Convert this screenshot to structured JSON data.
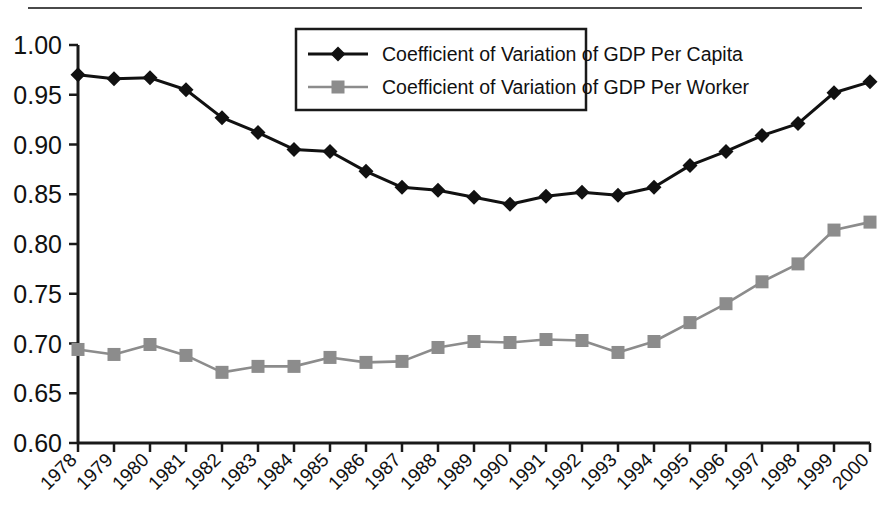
{
  "figure": {
    "has_top_rule": true,
    "background_color": "#ffffff"
  },
  "chart_data": {
    "type": "line",
    "title": "",
    "subtitle": "",
    "xlabel": "",
    "ylabel": "",
    "x": [
      1978,
      1979,
      1980,
      1981,
      1982,
      1983,
      1984,
      1985,
      1986,
      1987,
      1988,
      1989,
      1990,
      1991,
      1992,
      1993,
      1994,
      1995,
      1996,
      1997,
      1998,
      1999,
      2000
    ],
    "categories": [
      "1978",
      "1979",
      "1980",
      "1981",
      "1982",
      "1983",
      "1984",
      "1985",
      "1986",
      "1987",
      "1988",
      "1989",
      "1990",
      "1991",
      "1992",
      "1993",
      "1994",
      "1995",
      "1996",
      "1997",
      "1998",
      "1999",
      "2000"
    ],
    "series": [
      {
        "name": "Coefficient of Variation of GDP Per Capita",
        "color": "#111111",
        "marker": "diamond",
        "values": [
          0.97,
          0.966,
          0.967,
          0.955,
          0.927,
          0.912,
          0.895,
          0.893,
          0.873,
          0.857,
          0.854,
          0.847,
          0.84,
          0.848,
          0.852,
          0.849,
          0.857,
          0.879,
          0.893,
          0.909,
          0.921,
          0.952,
          0.963
        ]
      },
      {
        "name": "Coefficient of Variation of GDP Per Worker",
        "color": "#8c8c8c",
        "marker": "square",
        "values": [
          0.694,
          0.689,
          0.699,
          0.688,
          0.671,
          0.677,
          0.677,
          0.686,
          0.681,
          0.682,
          0.696,
          0.702,
          0.701,
          0.704,
          0.703,
          0.691,
          0.702,
          0.721,
          0.74,
          0.762,
          0.78,
          0.814,
          0.822
        ]
      }
    ],
    "ylim": [
      0.6,
      1.0
    ],
    "ytick_labels": [
      "1.00",
      "0.95",
      "0.90",
      "0.85",
      "0.80",
      "0.75",
      "0.70",
      "0.65",
      "0.60"
    ],
    "ytick_values": [
      1.0,
      0.95,
      0.9,
      0.85,
      0.8,
      0.75,
      0.7,
      0.65,
      0.6
    ],
    "grid": false,
    "legend_position": "top-center",
    "xtick_rotation": 45
  },
  "legend": {
    "entries": [
      {
        "label": "Coefficient of Variation of GDP Per Capita",
        "color": "#111111",
        "marker": "diamond"
      },
      {
        "label": "Coefficient of Variation of GDP Per Worker",
        "color": "#8c8c8c",
        "marker": "square"
      }
    ]
  }
}
